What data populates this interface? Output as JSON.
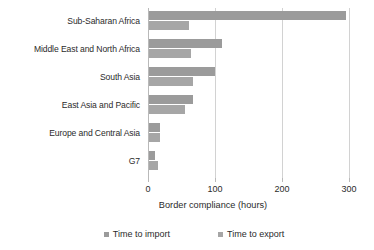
{
  "chart_data": {
    "type": "bar",
    "orientation": "horizontal",
    "title": "",
    "xlabel": "Border compliance (hours)",
    "ylabel": "",
    "xlim": [
      0,
      300
    ],
    "xticks": [
      0,
      100,
      200,
      300
    ],
    "xtick_labels": [
      "0",
      "100",
      "200",
      "300"
    ],
    "grid": true,
    "legend_position": "bottom",
    "categories": [
      "Sub-Saharan Africa",
      "Middle East and North Africa",
      "South Asia",
      "East Asia and Pacific",
      "Europe and Central Asia",
      "G7"
    ],
    "series": [
      {
        "name": "Time to import",
        "color": "#9b9b9b",
        "values": [
          294,
          109,
          98,
          65,
          17,
          9
        ]
      },
      {
        "name": "Time to export",
        "color": "#a6a6a6",
        "values": [
          59,
          62,
          65,
          54,
          16,
          13
        ]
      }
    ]
  },
  "axis": {
    "title": "Border compliance (hours)"
  },
  "legend": {
    "items": [
      {
        "label": "Time to import"
      },
      {
        "label": "Time to export"
      }
    ]
  }
}
